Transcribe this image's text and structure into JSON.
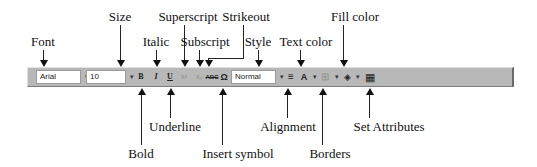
{
  "toolbar": {
    "font_value": "Arial",
    "size_value": "10",
    "style_value": "Normal",
    "bold_glyph": "B",
    "italic_glyph": "I",
    "underline_glyph": "U",
    "superscript_glyph": "x²",
    "subscript_glyph": "x₂",
    "strikeout_glyph": "ABC",
    "insert_symbol_glyph": "Ω",
    "alignment_glyph": "≡",
    "text_color_glyph": "A",
    "borders_glyph": "⊞",
    "fill_color_glyph": "◈",
    "set_attributes_glyph": "▦",
    "dropdown_glyph": "▾",
    "colors": {
      "toolbar_bg": "#b8b8b8",
      "field_bg": "#ffffff"
    }
  },
  "callouts_above": [
    {
      "id": "font",
      "label": "Font"
    },
    {
      "id": "size",
      "label": "Size"
    },
    {
      "id": "italic",
      "label": "Italic"
    },
    {
      "id": "superscript",
      "label": "Superscript"
    },
    {
      "id": "subscript",
      "label": "Subscript"
    },
    {
      "id": "strikeout",
      "label": "Strikeout"
    },
    {
      "id": "style",
      "label": "Style"
    },
    {
      "id": "text_color",
      "label": "Text color"
    },
    {
      "id": "fill_color",
      "label": "Fill color"
    }
  ],
  "callouts_below": [
    {
      "id": "bold",
      "label": "Bold"
    },
    {
      "id": "underline",
      "label": "Underline"
    },
    {
      "id": "insert_symbol",
      "label": "Insert symbol"
    },
    {
      "id": "alignment",
      "label": "Alignment"
    },
    {
      "id": "borders",
      "label": "Borders"
    },
    {
      "id": "set_attributes",
      "label": "Set Attributes"
    }
  ]
}
